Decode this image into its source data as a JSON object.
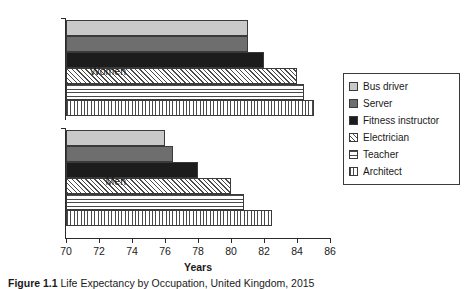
{
  "figure": {
    "caption_label": "Figure 1.1",
    "caption_text": "Life Expectancy by Occupation, United Kingdom, 2015"
  },
  "legend": {
    "position": "right",
    "items": [
      {
        "label": "Bus driver",
        "swatch": "solid-light-gray",
        "color": "#c9c9c9"
      },
      {
        "label": "Server",
        "swatch": "solid-mid-gray",
        "color": "#6e6e6e"
      },
      {
        "label": "Fitness instructor",
        "swatch": "solid-black",
        "color": "#1c1c1c"
      },
      {
        "label": "Electrician",
        "swatch": "diagonal-hatch",
        "color": "#4a4a4a"
      },
      {
        "label": "Teacher",
        "swatch": "horizontal-lines",
        "color": "#4a4a4a"
      },
      {
        "label": "Architect",
        "swatch": "vertical-lines",
        "color": "#4a4a4a"
      }
    ]
  },
  "axis": {
    "x_title": "Years",
    "x_ticks": [
      "70",
      "72",
      "74",
      "76",
      "78",
      "80",
      "82",
      "84",
      "86"
    ],
    "y_categories": [
      "Women",
      "Men"
    ]
  },
  "chart_data": {
    "type": "bar",
    "orientation": "horizontal",
    "title": "Life Expectancy by Occupation, United Kingdom, 2015",
    "xlabel": "Years",
    "ylabel": "",
    "xlim": [
      70,
      86
    ],
    "xticks": [
      70,
      72,
      74,
      76,
      78,
      80,
      82,
      84,
      86
    ],
    "grid": false,
    "legend_position": "right",
    "categories": [
      "Women",
      "Men"
    ],
    "series": [
      {
        "name": "Bus driver",
        "values": [
          81.0,
          76.0
        ]
      },
      {
        "name": "Server",
        "values": [
          81.0,
          76.5
        ]
      },
      {
        "name": "Fitness instructor",
        "values": [
          82.0,
          78.0
        ]
      },
      {
        "name": "Electrician",
        "values": [
          84.0,
          80.0
        ]
      },
      {
        "name": "Teacher",
        "values": [
          84.4,
          80.8
        ]
      },
      {
        "name": "Architect",
        "values": [
          85.0,
          82.5
        ]
      }
    ]
  }
}
